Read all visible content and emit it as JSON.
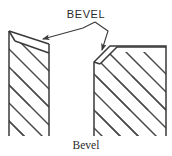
{
  "figure": {
    "title_caption": "Bevel",
    "callout_label": "BEVEL",
    "colors": {
      "background": "#ffffff",
      "outline": "#3a3a3a",
      "hatch": "#4a4a4a",
      "leader": "#3a3a3a",
      "text": "#2b2b2b"
    },
    "shapes": [
      {
        "name": "beveled-edge-left",
        "description": "slanted bevel face on top edge of plate",
        "outline_points": "9,31 49,44 49,136 9,136",
        "bevel_face_points": "9,31 49,44 49,52 16,41",
        "hatch_count": 5
      },
      {
        "name": "beveled-corner-right",
        "description": "chamfered top-left corner of block",
        "outline_points": "94,62 110,46 166,46 166,136 94,136",
        "hatch_count": 8
      }
    ],
    "leaders": [
      {
        "name": "leader-to-left-bevel",
        "path": "95,22 82,28 40,40",
        "arrow_at": "40,40"
      },
      {
        "name": "leader-to-right-bevel",
        "path": "95,22 108,32 102,54",
        "arrow_at": "102,54"
      }
    ]
  }
}
